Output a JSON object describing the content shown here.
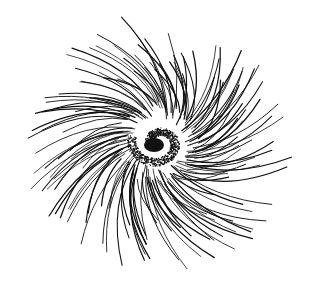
{
  "illustration": {
    "subject": "spiral-radiating-hair-drawing",
    "background": "#ffffff",
    "ink": "#111111",
    "center": {
      "x": 158,
      "y": 143
    },
    "core": {
      "outer_radius_x": 27,
      "outer_radius_y": 24,
      "inner_blob": {
        "x": 154,
        "y": 145,
        "rx": 10,
        "ry": 7
      },
      "stipple_count": 900
    },
    "rays": {
      "count": 150,
      "min_radius": 24,
      "max_radius_x": 138,
      "max_radius_y": 132,
      "swirl": 0.55,
      "seed": 7
    }
  }
}
